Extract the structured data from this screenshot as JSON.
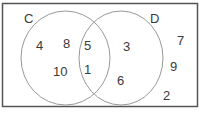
{
  "diagram": {
    "type": "venn",
    "sets": [
      {
        "name": "C",
        "label": "C"
      },
      {
        "name": "D",
        "label": "D"
      }
    ],
    "regions": {
      "only_C": [
        "4",
        "8",
        "10"
      ],
      "C_and_D": [
        "5",
        "1"
      ],
      "only_D": [
        "3",
        "6"
      ],
      "outside": [
        "7",
        "9",
        "2"
      ]
    },
    "colors": {
      "border": "#555555",
      "circle": "#999999",
      "text": "#3a3a3a"
    }
  }
}
